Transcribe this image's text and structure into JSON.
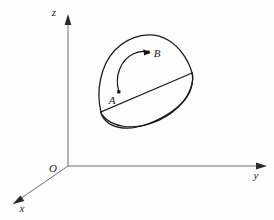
{
  "figure": {
    "kind": "3d-coordinate-diagram",
    "background_color": "#fdfdfd",
    "ink_color": "#1a1a1a",
    "axis_color": "#6e6e6e",
    "axes": [
      {
        "name": "z-axis",
        "label": "z",
        "label_x": 54,
        "label_y": 16,
        "direction": "up"
      },
      {
        "name": "y-axis",
        "label": "y",
        "label_x": 256,
        "label_y": 179,
        "direction": "right"
      },
      {
        "name": "x-axis",
        "label": "x",
        "label_x": 22,
        "label_y": 212,
        "direction": "down-left"
      }
    ],
    "origin": {
      "name": "origin",
      "label": "O",
      "label_x": 53,
      "label_y": 172,
      "point_x": 68,
      "point_y": 166
    },
    "points": [
      {
        "name": "point-A",
        "label": "A",
        "label_x": 112,
        "label_y": 104,
        "dot_x": 119,
        "dot_y": 92
      },
      {
        "name": "point-B",
        "label": "B",
        "label_x": 155,
        "label_y": 57,
        "dot_x": 148,
        "dot_y": 53
      }
    ],
    "surface": {
      "name": "curved-surface-with-elliptical-rim",
      "description": "dome-like curved surface patch, oriented in the first octant"
    },
    "oriented_path": {
      "name": "directed-arc-A-to-B",
      "from": "A",
      "to": "B",
      "has_arrowhead": true
    }
  }
}
